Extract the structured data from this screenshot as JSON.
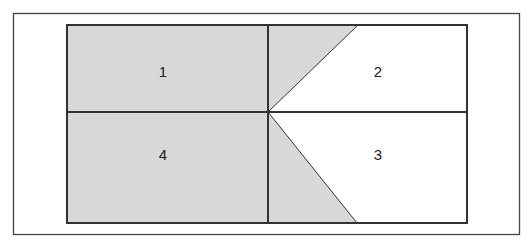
{
  "diagram": {
    "colors": {
      "shaded": "#d8d8d8",
      "unshaded": "#ffffff",
      "stroke": "#333333"
    },
    "regions": [
      {
        "id": "1",
        "label": "1"
      },
      {
        "id": "2",
        "label": "2"
      },
      {
        "id": "3",
        "label": "3"
      },
      {
        "id": "4",
        "label": "4"
      }
    ]
  }
}
